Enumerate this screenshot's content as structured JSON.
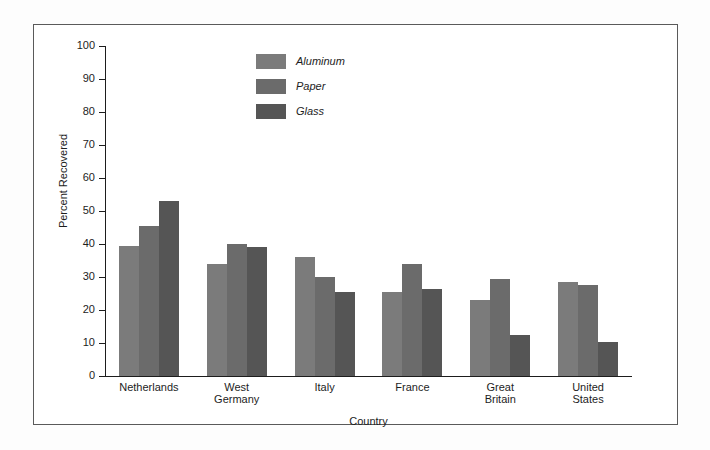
{
  "figure": {
    "background": "#ffffff",
    "frame_color": "#5a5a5a"
  },
  "legend": {
    "position": "top-center",
    "entries": [
      {
        "label": "Aluminum",
        "color": "#7b7b7b"
      },
      {
        "label": "Paper",
        "color": "#6b6b6b"
      },
      {
        "label": "Glass",
        "color": "#555555"
      }
    ]
  },
  "axis": {
    "y_title": "Percent Recovered",
    "x_title": "Country",
    "y_ticks": [
      "0",
      "10",
      "20",
      "30",
      "40",
      "50",
      "60",
      "70",
      "80",
      "90",
      "100"
    ]
  },
  "chart_data": {
    "type": "bar",
    "title": "",
    "xlabel": "Country",
    "ylabel": "Percent Recovered",
    "ylim": [
      0,
      100
    ],
    "ytick_step": 10,
    "grid": false,
    "legend_position": "top-center",
    "categories": [
      "Netherlands",
      "West Germany",
      "Italy",
      "France",
      "Great Britain",
      "United States"
    ],
    "category_lines": [
      [
        "Netherlands"
      ],
      [
        "West",
        "Germany"
      ],
      [
        "Italy"
      ],
      [
        "France"
      ],
      [
        "Great",
        "Britain"
      ],
      [
        "United",
        "States"
      ]
    ],
    "series": [
      {
        "name": "Aluminum",
        "color": "#7b7b7b",
        "values": [
          39.5,
          34,
          36,
          25.5,
          23,
          28.5
        ]
      },
      {
        "name": "Paper",
        "color": "#6b6b6b",
        "values": [
          45.5,
          40,
          30,
          34,
          29.5,
          27.5
        ]
      },
      {
        "name": "Glass",
        "color": "#555555",
        "values": [
          53,
          39,
          25.5,
          26.5,
          12.5,
          10.3
        ]
      }
    ]
  }
}
